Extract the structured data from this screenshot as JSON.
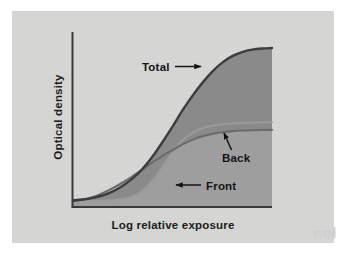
{
  "figure": {
    "background_color": "#ffffff",
    "panel_color": "#d6d6d4",
    "ghost_text": "nol"
  },
  "chart_data": {
    "type": "area",
    "title": "",
    "subtitle": "",
    "xlabel": "Log relative exposure",
    "ylabel": "Optical density",
    "xlim": [
      0,
      1
    ],
    "ylim": [
      0,
      1
    ],
    "xticks": [],
    "yticks": [],
    "xticklabels": [],
    "yticklabels": [],
    "grid": false,
    "legend": "none",
    "annotations": [
      {
        "id": "total",
        "label": "Total",
        "arrow": "right",
        "points_to": "total-curve"
      },
      {
        "id": "back",
        "label": "Back",
        "arrow": "up-left",
        "points_to": "back-curve"
      },
      {
        "id": "front",
        "label": "Front",
        "arrow": "left",
        "points_to": "front-curve"
      }
    ],
    "series": [
      {
        "name": "Total",
        "color": "#3c3c3c",
        "fill_color": "#8a8a8a",
        "description": "Sum of front and back emulsion densities; S-shaped characteristic curve reaching the highest maximum density.",
        "x": [
          0.0,
          0.05,
          0.1,
          0.15,
          0.2,
          0.25,
          0.3,
          0.35,
          0.4,
          0.45,
          0.5,
          0.55,
          0.6,
          0.65,
          0.7,
          0.75,
          0.8,
          0.85,
          0.9,
          0.95,
          1.0
        ],
        "y": [
          0.035,
          0.04,
          0.05,
          0.065,
          0.09,
          0.125,
          0.17,
          0.23,
          0.305,
          0.395,
          0.49,
          0.59,
          0.68,
          0.76,
          0.83,
          0.885,
          0.925,
          0.95,
          0.965,
          0.972,
          0.975
        ]
      },
      {
        "name": "Front",
        "color": "#9a9a9a",
        "description": "Front emulsion layer; low toe, then a steep rise with a later threshold than the back layer, plateauing slightly above the back curve.",
        "x": [
          0.0,
          0.05,
          0.1,
          0.15,
          0.2,
          0.25,
          0.3,
          0.35,
          0.4,
          0.45,
          0.5,
          0.55,
          0.6,
          0.65,
          0.7,
          0.75,
          0.8,
          0.85,
          0.9,
          0.95,
          1.0
        ],
        "y": [
          0.03,
          0.03,
          0.032,
          0.034,
          0.038,
          0.045,
          0.06,
          0.095,
          0.16,
          0.245,
          0.33,
          0.405,
          0.45,
          0.48,
          0.495,
          0.505,
          0.51,
          0.513,
          0.515,
          0.516,
          0.517
        ]
      },
      {
        "name": "Back",
        "color": "#6b6b6b",
        "fill_color": "#9e9e9e",
        "description": "Back emulsion layer; begins rising earlier with a gentler slope, plateauing slightly below the front curve.",
        "x": [
          0.0,
          0.05,
          0.1,
          0.15,
          0.2,
          0.25,
          0.3,
          0.35,
          0.4,
          0.45,
          0.5,
          0.55,
          0.6,
          0.65,
          0.7,
          0.75,
          0.8,
          0.85,
          0.9,
          0.95,
          1.0
        ],
        "y": [
          0.03,
          0.04,
          0.055,
          0.08,
          0.11,
          0.145,
          0.185,
          0.225,
          0.27,
          0.31,
          0.345,
          0.38,
          0.408,
          0.43,
          0.445,
          0.455,
          0.462,
          0.466,
          0.468,
          0.469,
          0.47
        ]
      }
    ]
  }
}
